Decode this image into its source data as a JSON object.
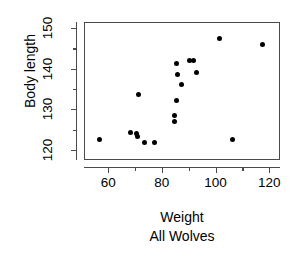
{
  "chart_data": {
    "type": "scatter",
    "title": "",
    "xlabel": "Weight",
    "sublabel": "All Wolves",
    "ylabel": "Body length",
    "xlim": [
      51,
      124
    ],
    "ylim": [
      117.5,
      151.5
    ],
    "xticks": [
      60,
      80,
      100,
      120
    ],
    "xminorticks": [
      70,
      90,
      110
    ],
    "yticks": [
      120,
      130,
      140,
      150
    ],
    "yminorticks": [
      125,
      135,
      145
    ],
    "grid": false,
    "legend": null,
    "marker": "filled-circle",
    "marker_color": "#000000",
    "series": [
      {
        "name": "All Wolves",
        "points": [
          {
            "x": 56.5,
            "y": 122.8
          },
          {
            "x": 68.0,
            "y": 124.5
          },
          {
            "x": 70.3,
            "y": 124.3
          },
          {
            "x": 70.5,
            "y": 123.6
          },
          {
            "x": 71.0,
            "y": 134.0
          },
          {
            "x": 73.0,
            "y": 122.0
          },
          {
            "x": 77.0,
            "y": 122.0
          },
          {
            "x": 84.2,
            "y": 128.8
          },
          {
            "x": 84.3,
            "y": 127.2
          },
          {
            "x": 85.0,
            "y": 132.5
          },
          {
            "x": 85.2,
            "y": 141.5
          },
          {
            "x": 85.5,
            "y": 138.8
          },
          {
            "x": 86.8,
            "y": 136.3
          },
          {
            "x": 89.8,
            "y": 142.3
          },
          {
            "x": 91.5,
            "y": 142.3
          },
          {
            "x": 92.5,
            "y": 139.3
          },
          {
            "x": 101.0,
            "y": 147.8
          },
          {
            "x": 105.8,
            "y": 122.7
          },
          {
            "x": 117.0,
            "y": 146.2
          }
        ]
      }
    ]
  },
  "axis": {
    "y_tick_labels": [
      "120",
      "130",
      "140",
      "150"
    ],
    "x_tick_labels": [
      "60",
      "80",
      "100",
      "120"
    ],
    "y_title": "Body length",
    "x_title": "Weight",
    "x_subtitle": "All Wolves"
  },
  "colors": {
    "marker": "#000000",
    "axis": "#4a4a4a",
    "background": "#ffffff",
    "text": "#000000"
  }
}
